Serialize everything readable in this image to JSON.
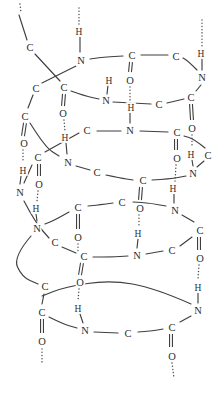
{
  "figure": {
    "background": "#ffffff",
    "line_color": "#3f3f3f",
    "hbond_color": "#4a4a4a",
    "text_color": "#2e2e2e",
    "atoms": [
      {
        "label": "C",
        "x": 30,
        "y": 47
      },
      {
        "label": "C",
        "x": 64,
        "y": 87
      },
      {
        "label": "O",
        "x": 63,
        "y": 113
      },
      {
        "label": "N",
        "x": 106,
        "y": 100
      },
      {
        "label": "H",
        "x": 109,
        "y": 80
      },
      {
        "label": "C",
        "x": 159,
        "y": 104
      },
      {
        "label": "C",
        "x": 191,
        "y": 97
      },
      {
        "label": "O",
        "x": 192,
        "y": 128
      },
      {
        "label": "N",
        "x": 202,
        "y": 77
      },
      {
        "label": "H",
        "x": 201,
        "y": 53
      },
      {
        "label": "C",
        "x": 176,
        "y": 56
      },
      {
        "label": "C",
        "x": 132,
        "y": 55
      },
      {
        "label": "O",
        "x": 130,
        "y": 80
      },
      {
        "label": "N",
        "x": 81,
        "y": 60
      },
      {
        "label": "H",
        "x": 79,
        "y": 31
      },
      {
        "label": "C",
        "x": 36,
        "y": 88
      },
      {
        "label": "C",
        "x": 25,
        "y": 116
      },
      {
        "label": "O",
        "x": 24,
        "y": 143
      },
      {
        "label": "N",
        "x": 68,
        "y": 162
      },
      {
        "label": "H",
        "x": 65,
        "y": 137
      },
      {
        "label": "C",
        "x": 97,
        "y": 172
      },
      {
        "label": "C",
        "x": 143,
        "y": 180
      },
      {
        "label": "O",
        "x": 140,
        "y": 208
      },
      {
        "label": "N",
        "x": 193,
        "y": 173
      },
      {
        "label": "H",
        "x": 191,
        "y": 154
      },
      {
        "label": "C",
        "x": 208,
        "y": 155
      },
      {
        "label": "C",
        "x": 177,
        "y": 132
      },
      {
        "label": "O",
        "x": 177,
        "y": 158
      },
      {
        "label": "N",
        "x": 130,
        "y": 130
      },
      {
        "label": "H",
        "x": 131,
        "y": 107
      },
      {
        "label": "C",
        "x": 87,
        "y": 130
      },
      {
        "label": "C",
        "x": 38,
        "y": 157
      },
      {
        "label": "O",
        "x": 39,
        "y": 184
      },
      {
        "label": "N",
        "x": 20,
        "y": 192
      },
      {
        "label": "H",
        "x": 23,
        "y": 170
      },
      {
        "label": "C",
        "x": 55,
        "y": 242
      },
      {
        "label": "C",
        "x": 84,
        "y": 256
      },
      {
        "label": "O",
        "x": 80,
        "y": 282
      },
      {
        "label": "N",
        "x": 137,
        "y": 255
      },
      {
        "label": "H",
        "x": 138,
        "y": 233
      },
      {
        "label": "C",
        "x": 172,
        "y": 250
      },
      {
        "label": "C",
        "x": 200,
        "y": 230
      },
      {
        "label": "O",
        "x": 200,
        "y": 258
      },
      {
        "label": "N",
        "x": 175,
        "y": 210
      },
      {
        "label": "H",
        "x": 173,
        "y": 188
      },
      {
        "label": "C",
        "x": 122,
        "y": 202
      },
      {
        "label": "C",
        "x": 78,
        "y": 207
      },
      {
        "label": "O",
        "x": 78,
        "y": 237
      },
      {
        "label": "N",
        "x": 37,
        "y": 228
      },
      {
        "label": "H",
        "x": 36,
        "y": 208
      },
      {
        "label": "C",
        "x": 45,
        "y": 286
      },
      {
        "label": "C",
        "x": 42,
        "y": 312
      },
      {
        "label": "O",
        "x": 42,
        "y": 341
      },
      {
        "label": "N",
        "x": 85,
        "y": 330
      },
      {
        "label": "H",
        "x": 78,
        "y": 308
      },
      {
        "label": "C",
        "x": 128,
        "y": 333
      },
      {
        "label": "C",
        "x": 172,
        "y": 327
      },
      {
        "label": "O",
        "x": 172,
        "y": 356
      },
      {
        "label": "N",
        "x": 198,
        "y": 310
      },
      {
        "label": "H",
        "x": 198,
        "y": 287
      }
    ],
    "bonds": [
      [
        [
          19,
          15
        ],
        [
          27,
          40
        ]
      ],
      [
        [
          35,
          54
        ],
        [
          60,
          81
        ]
      ],
      [
        [
          71,
          91
        ],
        [
          85,
          96
        ],
        [
          99,
          99
        ]
      ],
      [
        [
          113,
          102
        ],
        [
          151,
          104
        ]
      ],
      [
        [
          167,
          103
        ],
        [
          184,
          99
        ]
      ],
      [
        [
          196,
          91
        ],
        [
          201,
          85
        ]
      ],
      [
        [
          197,
          70
        ],
        [
          188,
          61
        ],
        [
          183,
          58
        ]
      ],
      [
        [
          168,
          55
        ],
        [
          141,
          55
        ]
      ],
      [
        [
          123,
          56
        ],
        [
          104,
          57
        ],
        [
          90,
          59
        ]
      ],
      [
        [
          76,
          66
        ],
        [
          58,
          75
        ],
        [
          42,
          83
        ]
      ],
      [
        [
          33,
          95
        ],
        [
          28,
          108
        ]
      ],
      [
        [
          30,
          123
        ],
        [
          45,
          147
        ],
        [
          59,
          156
        ]
      ],
      [
        [
          76,
          166
        ],
        [
          90,
          170
        ]
      ],
      [
        [
          106,
          175
        ],
        [
          120,
          178
        ],
        [
          133,
          180
        ]
      ],
      [
        [
          152,
          180
        ],
        [
          170,
          179
        ],
        [
          186,
          176
        ]
      ],
      [
        [
          197,
          167
        ],
        [
          204,
          161
        ]
      ],
      [
        [
          205,
          148
        ],
        [
          194,
          139
        ],
        [
          184,
          136
        ]
      ],
      [
        [
          168,
          132
        ],
        [
          140,
          131
        ]
      ],
      [
        [
          121,
          131
        ],
        [
          97,
          131
        ]
      ],
      [
        [
          79,
          133
        ],
        [
          45,
          152
        ]
      ],
      [
        [
          32,
          165
        ],
        [
          24,
          183
        ]
      ],
      [
        [
          24,
          201
        ],
        [
          35,
          222
        ],
        [
          49,
          238
        ]
      ],
      [
        [
          62,
          247
        ],
        [
          76,
          253
        ]
      ],
      [
        [
          93,
          257
        ],
        [
          112,
          257
        ],
        [
          128,
          256
        ]
      ],
      [
        [
          146,
          254
        ],
        [
          163,
          251
        ]
      ],
      [
        [
          180,
          246
        ],
        [
          192,
          237
        ]
      ],
      [
        [
          194,
          222
        ],
        [
          182,
          215
        ]
      ],
      [
        [
          166,
          206
        ],
        [
          150,
          203
        ],
        [
          133,
          202
        ]
      ],
      [
        [
          113,
          203
        ],
        [
          98,
          205
        ],
        [
          88,
          206
        ]
      ],
      [
        [
          69,
          212
        ],
        [
          55,
          220
        ],
        [
          45,
          224
        ]
      ],
      [
        [
          31,
          236
        ],
        [
          13,
          257
        ],
        [
          22,
          277
        ],
        [
          38,
          284
        ]
      ],
      [
        [
          44,
          294
        ],
        [
          42,
          304
        ]
      ],
      [
        [
          49,
          317
        ],
        [
          63,
          324
        ],
        [
          77,
          328
        ]
      ],
      [
        [
          94,
          332
        ],
        [
          118,
          333
        ]
      ],
      [
        [
          138,
          332
        ],
        [
          152,
          331
        ],
        [
          163,
          329
        ]
      ],
      [
        [
          180,
          322
        ],
        [
          191,
          316
        ]
      ],
      [
        [
          191,
          304
        ],
        [
          155,
          288
        ],
        [
          110,
          280
        ],
        [
          65,
          287
        ],
        [
          42,
          296
        ]
      ],
      [
        [
          108,
          85
        ],
        [
          107,
          94
        ]
      ],
      [
        [
          202,
          59
        ],
        [
          202,
          70
        ]
      ],
      [
        [
          80,
          37
        ],
        [
          80,
          52
        ]
      ],
      [
        [
          66,
          143
        ],
        [
          67,
          154
        ]
      ],
      [
        [
          192,
          160
        ],
        [
          193,
          166
        ]
      ],
      [
        [
          130,
          113
        ],
        [
          130,
          123
        ]
      ],
      [
        [
          21,
          176
        ],
        [
          20,
          184
        ]
      ],
      [
        [
          36,
          214
        ],
        [
          37,
          221
        ]
      ],
      [
        [
          138,
          239
        ],
        [
          137,
          248
        ]
      ],
      [
        [
          174,
          194
        ],
        [
          174,
          203
        ]
      ],
      [
        [
          80,
          314
        ],
        [
          83,
          323
        ]
      ],
      [
        [
          198,
          293
        ],
        [
          198,
          303
        ]
      ]
    ],
    "double_bonds": [
      [
        64,
        94,
        63,
        106
      ],
      [
        191,
        104,
        192,
        120
      ],
      [
        131,
        62,
        130,
        72
      ],
      [
        25,
        123,
        23,
        136
      ],
      [
        141,
        187,
        140,
        200
      ],
      [
        176,
        139,
        176,
        150
      ],
      [
        39,
        164,
        39,
        176
      ],
      [
        82,
        263,
        80,
        275
      ],
      [
        199,
        237,
        199,
        250
      ],
      [
        78,
        214,
        78,
        229
      ],
      [
        42,
        319,
        42,
        333
      ],
      [
        171,
        334,
        171,
        347
      ]
    ],
    "hbonds": [
      [
        [
          79,
          8
        ],
        [
          79,
          25
        ]
      ],
      [
        [
          202,
          20
        ],
        [
          202,
          46
        ]
      ],
      [
        [
          64,
          120
        ],
        [
          65,
          131
        ]
      ],
      [
        [
          130,
          87
        ],
        [
          130,
          100
        ]
      ],
      [
        [
          192,
          135
        ],
        [
          192,
          147
        ]
      ],
      [
        [
          23,
          150
        ],
        [
          23,
          162
        ]
      ],
      [
        [
          176,
          165
        ],
        [
          175,
          181
        ]
      ],
      [
        [
          139,
          215
        ],
        [
          139,
          227
        ]
      ],
      [
        [
          38,
          191
        ],
        [
          37,
          201
        ]
      ],
      [
        [
          78,
          244
        ],
        [
          78,
          252
        ]
      ],
      [
        [
          79,
          289
        ],
        [
          78,
          301
        ]
      ],
      [
        [
          199,
          265
        ],
        [
          198,
          279
        ]
      ],
      [
        [
          42,
          349
        ],
        [
          42,
          362
        ]
      ],
      [
        [
          172,
          363
        ],
        [
          174,
          378
        ]
      ],
      [
        [
          20,
          4
        ],
        [
          21,
          13
        ]
      ]
    ]
  }
}
